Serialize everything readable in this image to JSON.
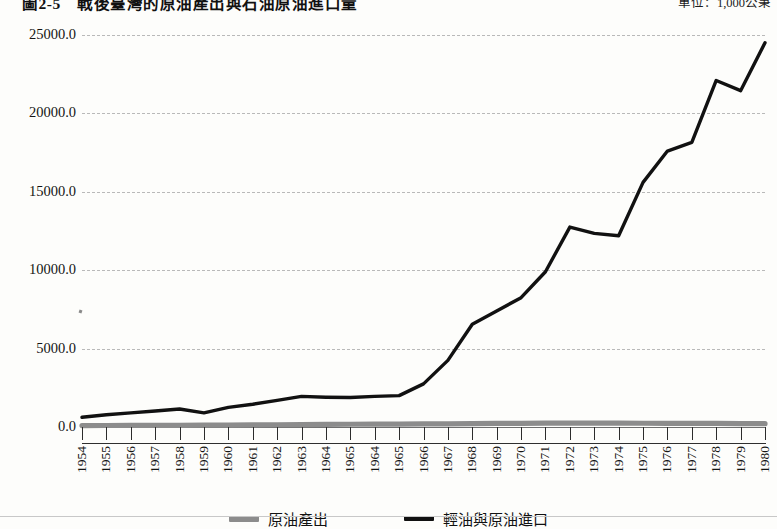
{
  "figure": {
    "title": "圖2-5　戰後臺灣的原油產出與石油原油進口量",
    "unit_label": "單位：1,000公秉"
  },
  "legend": {
    "position": "bottom",
    "items": [
      {
        "label": "原油產出",
        "color": "#8c8c8c",
        "name": "crude-oil-output"
      },
      {
        "label": "輕油與原油進口",
        "color": "#111111",
        "name": "light-oil-crude-import"
      }
    ]
  },
  "chart_data": {
    "type": "line",
    "title": "圖2-5　戰後臺灣的原油產出與石油原油進口量",
    "xlabel": "",
    "ylabel": "",
    "unit": "1,000公秉",
    "grid": true,
    "ylim": [
      0,
      25000
    ],
    "yticks": [
      "0.0",
      "5000.0",
      "10000.0",
      "15000.0",
      "20000.0",
      "25000.0"
    ],
    "ytick_values": [
      0,
      5000,
      10000,
      15000,
      20000,
      25000
    ],
    "categories": [
      "1954",
      "1955",
      "1956",
      "1957",
      "1958",
      "1959",
      "1960",
      "1961",
      "1962",
      "1963",
      "1964",
      "1965",
      "1964",
      "1965",
      "1966",
      "1967",
      "1968",
      "1969",
      "1970",
      "1971",
      "1972",
      "1973",
      "1974",
      "1975",
      "1976",
      "1977",
      "1978",
      "1979",
      "1980"
    ],
    "series": [
      {
        "name": "原油產出",
        "color": "#8c8c8c",
        "values": [
          90,
          95,
          100,
          105,
          110,
          115,
          125,
          135,
          145,
          155,
          165,
          175,
          180,
          185,
          195,
          205,
          215,
          225,
          235,
          245,
          250,
          250,
          245,
          240,
          235,
          230,
          225,
          220,
          215
        ]
      },
      {
        "name": "輕油與原油進口",
        "color": "#111111",
        "values": [
          620,
          780,
          900,
          1020,
          1150,
          900,
          1250,
          1450,
          1700,
          1950,
          1900,
          1880,
          1950,
          2000,
          2750,
          4250,
          6550,
          7400,
          8250,
          9900,
          12750,
          12350,
          12200,
          15600,
          17600,
          18150,
          22100,
          21450,
          24500
        ]
      }
    ]
  }
}
